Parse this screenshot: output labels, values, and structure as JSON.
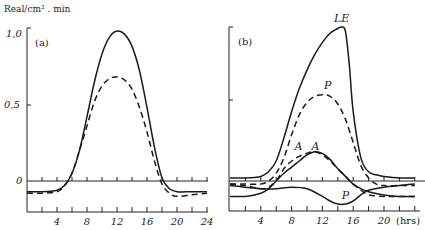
{
  "chart_data": [
    {
      "panel": "(a)",
      "type": "line",
      "ylabel": "Real/cm² . min",
      "xlabel": "",
      "xlim": [
        0,
        24
      ],
      "ylim": [
        -0.2,
        1.0
      ],
      "yticks": [
        {
          "value": 1.0,
          "label": "1,0"
        },
        {
          "value": 0.5,
          "label": "0,5"
        },
        {
          "value": 0,
          "label": "0"
        }
      ],
      "xticks": [
        4,
        8,
        12,
        16,
        20,
        24
      ],
      "grid": false,
      "series": [
        {
          "name": "solid",
          "style": "solid",
          "x": [
            0,
            2,
            4,
            5,
            6,
            7,
            8,
            9,
            10,
            11,
            12,
            13,
            14,
            15,
            16,
            17,
            18,
            19,
            20,
            22,
            24
          ],
          "y": [
            -0.07,
            -0.07,
            -0.06,
            -0.03,
            0.05,
            0.2,
            0.42,
            0.65,
            0.83,
            0.94,
            0.98,
            0.96,
            0.88,
            0.72,
            0.48,
            0.22,
            0.02,
            -0.05,
            -0.07,
            -0.07,
            -0.07
          ]
        },
        {
          "name": "dashed",
          "style": "dashed",
          "x": [
            0,
            2,
            4,
            5,
            6,
            7,
            8,
            9,
            10,
            11,
            12,
            13,
            14,
            15,
            16,
            17,
            18,
            19,
            20,
            22,
            24
          ],
          "y": [
            -0.08,
            -0.08,
            -0.07,
            -0.03,
            0.05,
            0.2,
            0.36,
            0.52,
            0.62,
            0.67,
            0.68,
            0.66,
            0.6,
            0.48,
            0.32,
            0.13,
            -0.02,
            -0.08,
            -0.1,
            -0.09,
            -0.08
          ]
        }
      ]
    },
    {
      "panel": "(b)",
      "type": "line",
      "xlabel": "(hrs)",
      "xlim": [
        0,
        24
      ],
      "ylim": [
        -0.2,
        1.0
      ],
      "xticks": [
        4,
        8,
        12,
        16,
        20
      ],
      "grid": false,
      "series": [
        {
          "name": "LE",
          "style": "solid",
          "x": [
            0,
            2,
            4,
            5,
            6,
            7,
            8,
            9,
            10,
            11,
            12,
            13,
            14,
            14.5,
            15,
            15.5,
            16,
            17,
            18,
            19,
            20,
            22,
            24
          ],
          "y": [
            0.02,
            0.02,
            0.03,
            0.06,
            0.13,
            0.28,
            0.45,
            0.6,
            0.72,
            0.82,
            0.9,
            0.96,
            0.99,
            1.0,
            0.97,
            0.75,
            0.45,
            0.15,
            0.06,
            0.04,
            0.03,
            0.02,
            0.02
          ]
        },
        {
          "name": "P",
          "style": "dashed",
          "x": [
            0,
            2,
            4,
            5,
            6,
            7,
            8,
            9,
            10,
            11,
            12,
            13,
            14,
            15,
            16,
            17,
            18,
            19,
            20,
            22,
            24
          ],
          "y": [
            -0.02,
            -0.02,
            -0.02,
            0.0,
            0.05,
            0.15,
            0.3,
            0.43,
            0.51,
            0.55,
            0.56,
            0.55,
            0.5,
            0.4,
            0.25,
            0.1,
            0.02,
            -0.02,
            -0.03,
            -0.03,
            -0.03
          ]
        },
        {
          "name": "A (solid)",
          "style": "solid",
          "x": [
            0,
            2,
            4,
            5,
            6,
            7,
            8,
            9,
            10,
            11,
            12,
            13,
            14,
            15,
            16,
            17,
            18,
            20,
            22,
            24
          ],
          "y": [
            -0.1,
            -0.1,
            -0.08,
            -0.05,
            0.0,
            0.05,
            0.09,
            0.13,
            0.17,
            0.19,
            0.18,
            0.14,
            0.08,
            0.03,
            -0.02,
            -0.05,
            -0.07,
            -0.09,
            -0.1,
            -0.1
          ]
        },
        {
          "name": "A (dashed)",
          "style": "dashed",
          "x": [
            0,
            2,
            4,
            5,
            6,
            7,
            8,
            9,
            10,
            11,
            12,
            13,
            14,
            15,
            16,
            17,
            18,
            20,
            22,
            24
          ],
          "y": [
            -0.02,
            -0.03,
            -0.05,
            -0.04,
            0.0,
            0.08,
            0.13,
            0.16,
            0.18,
            0.19,
            0.17,
            0.13,
            0.08,
            0.03,
            -0.02,
            -0.06,
            -0.09,
            -0.1,
            -0.1,
            -0.1
          ]
        },
        {
          "name": "P (negative)",
          "style": "solid",
          "x": [
            0,
            2,
            4,
            6,
            8,
            10,
            12,
            13,
            14,
            15,
            16,
            17,
            18,
            20,
            22,
            24
          ],
          "y": [
            -0.03,
            -0.04,
            -0.05,
            -0.05,
            -0.04,
            -0.05,
            -0.1,
            -0.13,
            -0.15,
            -0.15,
            -0.13,
            -0.09,
            -0.06,
            -0.04,
            -0.03,
            -0.02
          ]
        }
      ],
      "annotations": [
        {
          "text": "LE",
          "x": 14.5,
          "y": 1.03
        },
        {
          "text": "P",
          "x": 12.7,
          "y": 0.6
        },
        {
          "text": "A",
          "x": 8.9,
          "y": 0.2
        },
        {
          "text": "A",
          "x": 11.1,
          "y": 0.2
        },
        {
          "text": "P",
          "x": 15.0,
          "y": -0.12
        }
      ]
    }
  ],
  "labels": {
    "ylabel": "Real/cm² . min",
    "panel_a": "(a)",
    "panel_b": "(b)",
    "xunit": "(hrs)",
    "ytick_top": "1,0",
    "ytick_mid": "0,5",
    "ytick_zero": "0"
  }
}
